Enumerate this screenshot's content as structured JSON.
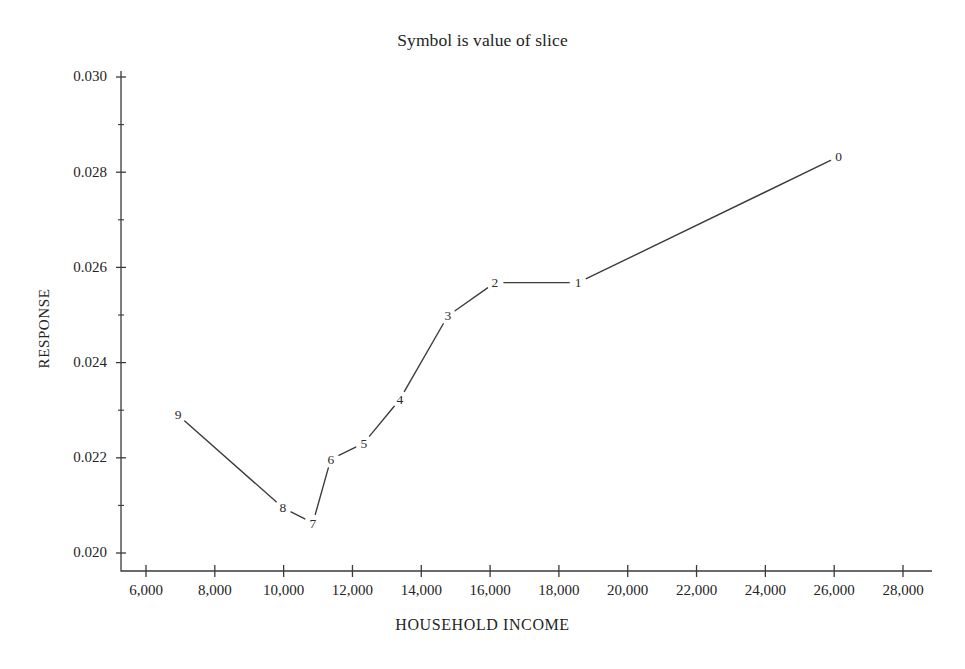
{
  "chart_data": {
    "type": "line",
    "title": "Symbol is value of slice",
    "xlabel": "HOUSEHOLD INCOME",
    "ylabel": "RESPONSE",
    "xlim": [
      5200,
      928
    ],
    "x_axis_range": [
      5200,
      29000
    ],
    "ylim": [
      0.0196,
      0.0303
    ],
    "grid": false,
    "legend": "none",
    "point_labels_are": "value of slice",
    "series": [
      {
        "name": "response by household income",
        "labels": [
          "9",
          "8",
          "7",
          "6",
          "5",
          "4",
          "3",
          "2",
          "1",
          "0"
        ],
        "x": [
          6930,
          9980,
          10850,
          11370,
          12330,
          13380,
          14770,
          16140,
          18560,
          26130
        ],
        "y": [
          0.0229,
          0.02095,
          0.02063,
          0.02197,
          0.02231,
          0.02323,
          0.02498,
          0.02568,
          0.02568,
          0.02833
        ]
      }
    ],
    "x_ticks": [
      {
        "value": 6000,
        "label": "6,000"
      },
      {
        "value": 8000,
        "label": "8,000"
      },
      {
        "value": 10000,
        "label": "10,000"
      },
      {
        "value": 12000,
        "label": "12,000"
      },
      {
        "value": 14000,
        "label": "14,000"
      },
      {
        "value": 16000,
        "label": "16,000"
      },
      {
        "value": 18000,
        "label": "18,000"
      },
      {
        "value": 20000,
        "label": "20,000"
      },
      {
        "value": 22000,
        "label": "22,000"
      },
      {
        "value": 24000,
        "label": "24,000"
      },
      {
        "value": 26000,
        "label": "26,000"
      },
      {
        "value": 28000,
        "label": "28,000"
      }
    ],
    "y_ticks": [
      {
        "value": 0.02,
        "label": "0.020"
      },
      {
        "value": 0.022,
        "label": "0.022"
      },
      {
        "value": 0.024,
        "label": "0.024"
      },
      {
        "value": 0.026,
        "label": "0.026"
      },
      {
        "value": 0.028,
        "label": "0.028"
      },
      {
        "value": 0.03,
        "label": "0.030"
      }
    ],
    "y_minor_ticks": [
      0.021,
      0.023,
      0.025,
      0.027,
      0.029
    ],
    "colors": {
      "line": "#3c3c3c",
      "axis": "#3a3a3a",
      "text": "#242424",
      "background": "#ffffff"
    }
  }
}
